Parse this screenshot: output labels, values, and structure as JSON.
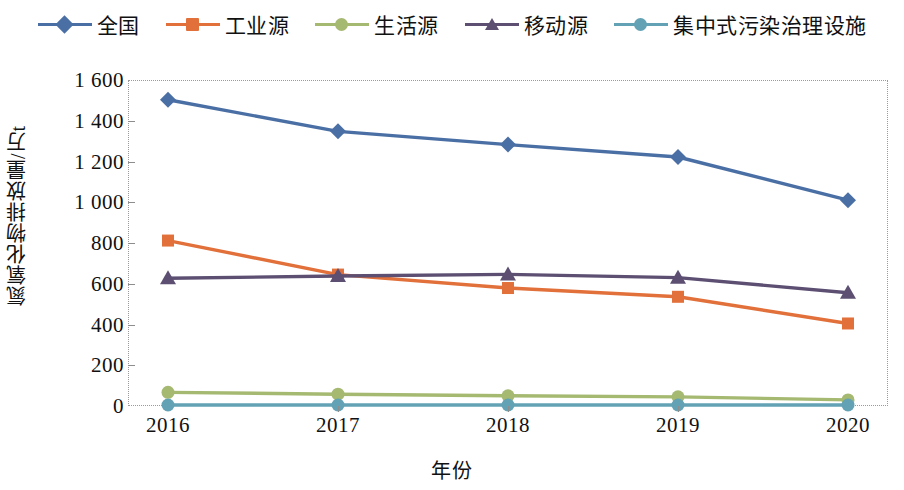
{
  "chart_data": {
    "type": "line",
    "title": "",
    "xlabel": "年份",
    "ylabel": "氮氧化物排放量/万t",
    "categories": [
      "2016",
      "2017",
      "2018",
      "2019",
      "2020"
    ],
    "x": [
      2016,
      2017,
      2018,
      2019,
      2020
    ],
    "ylim": [
      0,
      1600
    ],
    "yticks": [
      "0",
      "200",
      "400",
      "600",
      "800",
      "1 000",
      "1 200",
      "1 400",
      "1 600"
    ],
    "ytick_values": [
      0,
      200,
      400,
      600,
      800,
      1000,
      1200,
      1400,
      1600
    ],
    "grid": false,
    "legend_position": "top",
    "series": [
      {
        "name": "全国",
        "color": "#4A6FA5",
        "marker": "diamond",
        "values": [
          1503,
          1348,
          1283,
          1222,
          1010
        ]
      },
      {
        "name": "工业源",
        "color": "#E2703A",
        "marker": "square",
        "values": [
          812,
          645,
          579,
          536,
          405
        ]
      },
      {
        "name": "生活源",
        "color": "#A5B971",
        "marker": "circle",
        "values": [
          67,
          58,
          50,
          45,
          30
        ]
      },
      {
        "name": "移动源",
        "color": "#5C4F72",
        "marker": "triangle",
        "values": [
          627,
          638,
          646,
          630,
          556
        ]
      },
      {
        "name": "集中式污染治理设施",
        "color": "#63A2B5",
        "marker": "circle",
        "values": [
          5,
          5,
          5,
          5,
          5
        ]
      }
    ]
  },
  "legend": {
    "items": [
      {
        "label": "全国",
        "color": "#4A6FA5",
        "marker": "diamond"
      },
      {
        "label": "工业源",
        "color": "#E2703A",
        "marker": "square"
      },
      {
        "label": "生活源",
        "color": "#A5B971",
        "marker": "circle"
      },
      {
        "label": "移动源",
        "color": "#5C4F72",
        "marker": "triangle"
      },
      {
        "label": "集中式污染治理设施",
        "color": "#63A2B5",
        "marker": "circle"
      }
    ]
  }
}
